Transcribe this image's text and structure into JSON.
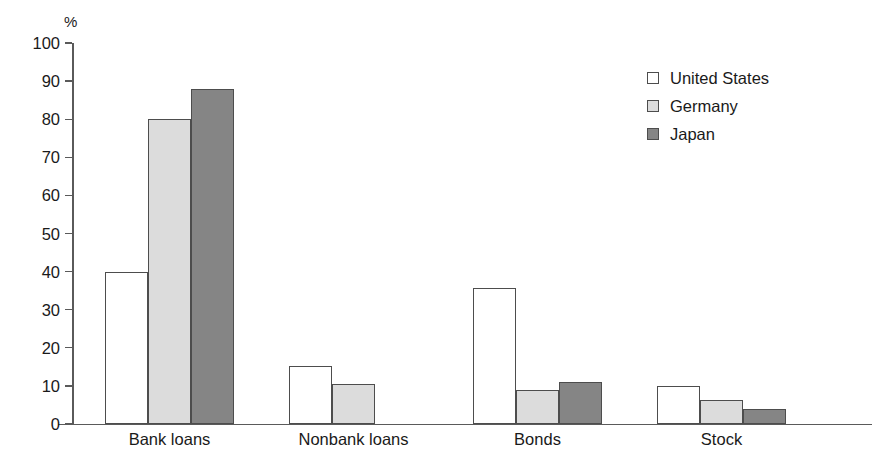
{
  "chart_data": {
    "type": "bar",
    "title": "",
    "subtitle": "",
    "xlabel": "",
    "ylabel": "%",
    "unit_label": "%",
    "categories": [
      "Bank loans",
      "Nonbank loans",
      "Bonds",
      "Stock"
    ],
    "series": [
      {
        "name": "United States",
        "color": "#ffffff",
        "values": [
          40,
          15.2,
          35.6,
          10
        ]
      },
      {
        "name": "Germany",
        "color": "#dcdcdc",
        "values": [
          80,
          10.4,
          8.8,
          6.2
        ]
      },
      {
        "name": "Japan",
        "color": "#858585",
        "values": [
          88,
          0,
          11,
          4
        ]
      }
    ],
    "ylim": [
      0,
      100
    ],
    "ytick_labels": [
      "100",
      "90",
      "80",
      "70",
      "60",
      "50",
      "40",
      "30",
      "20",
      "10",
      "0"
    ],
    "ytick_values": [
      100,
      90,
      80,
      70,
      60,
      50,
      40,
      30,
      20,
      10,
      0
    ],
    "grid": false,
    "legend_position": "top-right",
    "axis_color": "#5a5a5a",
    "bar_border_color": "#4d4d4d"
  },
  "legend": {
    "entries": [
      {
        "label": "United States"
      },
      {
        "label": "Germany"
      },
      {
        "label": "Japan"
      }
    ]
  }
}
